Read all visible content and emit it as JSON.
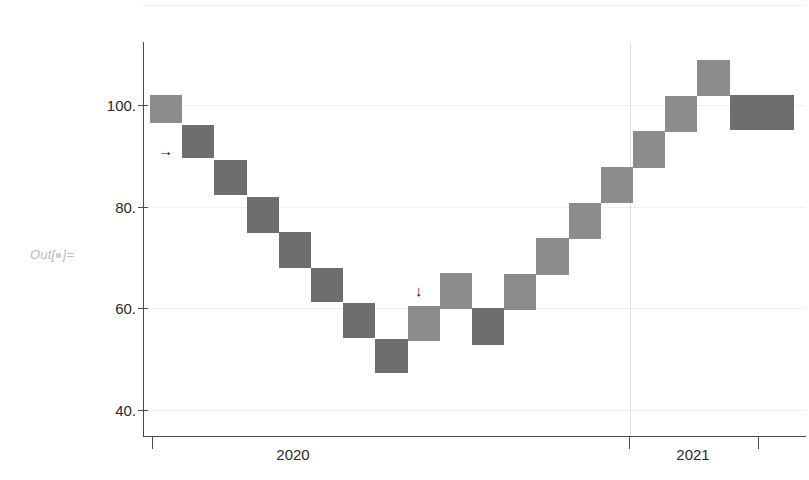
{
  "prompt": {
    "label_prefix": "Out[",
    "label_suffix": "]="
  },
  "chart_data": {
    "type": "bar",
    "title": "",
    "subtitle": "",
    "xlabel": "",
    "ylabel": "",
    "grid": "horizontal-and-vertical",
    "legend": "none",
    "ylim": [
      33,
      115
    ],
    "ytick_values": [
      100,
      80,
      60,
      40
    ],
    "ytick_labels": [
      "100.",
      "80.",
      "60.",
      "40."
    ],
    "xtick_values": [
      2020,
      2021
    ],
    "xtick_labels": [
      "2020",
      "2021"
    ],
    "axis_colors": {
      "axis": "#4a4a4a",
      "grid": "#f0f0f2",
      "grid_vertical": "#e2e2e6",
      "bar_light": "#8c8c8c",
      "bar_dark": "#6e6e6e"
    },
    "series": [
      {
        "name": "value",
        "note": "step / candle blocks, one block per period; value = block center",
        "categories": [
          1,
          2,
          3,
          4,
          5,
          6,
          7,
          8,
          9,
          10,
          11,
          12,
          13,
          14,
          15,
          16,
          17,
          18,
          19,
          20
        ],
        "values": [
          99.5,
          92.8,
          85.7,
          78.4,
          71.5,
          64.6,
          57.6,
          50.6,
          57.0,
          63.4,
          56.4,
          63.2,
          70.2,
          77.3,
          84.3,
          91.2,
          98.2,
          105.2,
          98.4,
          98.4
        ],
        "block_tops": [
          102.0,
          96.0,
          89.2,
          82.0,
          75.0,
          68.0,
          61.0,
          54.0,
          60.5,
          67.0,
          60.0,
          66.8,
          73.8,
          80.8,
          87.8,
          94.8,
          101.8,
          108.8,
          102.0,
          102.0
        ],
        "block_bottoms": [
          96.5,
          89.5,
          82.2,
          74.8,
          68.0,
          61.2,
          54.2,
          47.2,
          53.5,
          59.8,
          52.8,
          59.6,
          66.6,
          73.7,
          80.8,
          87.7,
          94.7,
          101.7,
          95.0,
          95.0
        ],
        "shades": [
          "light",
          "dark",
          "dark",
          "dark",
          "dark",
          "dark",
          "dark",
          "dark",
          "light",
          "light",
          "dark",
          "light",
          "light",
          "light",
          "light",
          "light",
          "light",
          "light",
          "dark",
          "dark"
        ]
      }
    ],
    "annotations": [
      {
        "name": "right-arrow-annotation",
        "glyph": "→",
        "x_px": 158,
        "y_px": 143
      },
      {
        "name": "down-arrow-annotation",
        "glyph": "↓",
        "x_px": 415,
        "y_px": 283
      }
    ]
  }
}
